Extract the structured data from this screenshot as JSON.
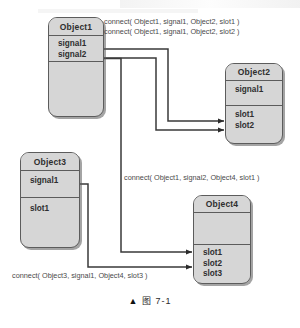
{
  "figure": {
    "caption_marker": "▲",
    "caption_label": "图",
    "caption_number": "7-1",
    "type": "signals-and-slots connection diagram"
  },
  "palette": {
    "box_fill": "#d6d6d6",
    "box_border": "#5c5c5c",
    "wire": "#3a3a3a",
    "text": "#2e2e2e",
    "label_text": "#4a4a4a",
    "page_background": "#ffffff"
  },
  "objects": [
    {
      "id": "object1",
      "title": "Object1",
      "signals": [
        "signal1",
        "signal2"
      ],
      "slots": []
    },
    {
      "id": "object2",
      "title": "Object2",
      "signals": [
        "signal1"
      ],
      "slots": [
        "slot1",
        "slot2"
      ]
    },
    {
      "id": "object3",
      "title": "Object3",
      "signals": [
        "signal1"
      ],
      "slots": [
        "slot1"
      ]
    },
    {
      "id": "object4",
      "title": "Object4",
      "signals": [],
      "slots": [
        "slot1",
        "slot2",
        "slot3"
      ]
    }
  ],
  "connections": [
    {
      "id": "conn1",
      "label": "connect( Object1, signal1, Object2, slot1 )",
      "from_object": "Object1",
      "from_signal": "signal1",
      "to_object": "Object2",
      "to_slot": "slot1"
    },
    {
      "id": "conn2",
      "label": "connect( Object1, signal1, Object2, slot2 )",
      "from_object": "Object1",
      "from_signal": "signal1",
      "to_object": "Object2",
      "to_slot": "slot2"
    },
    {
      "id": "conn3",
      "label": "connect( Object1, signal2, Object4, slot1 )",
      "from_object": "Object1",
      "from_signal": "signal2",
      "to_object": "Object4",
      "to_slot": "slot1"
    },
    {
      "id": "conn4",
      "label": "connect( Object3, signal1, Object4, slot3 )",
      "from_object": "Object3",
      "from_signal": "signal1",
      "to_object": "Object4",
      "to_slot": "slot3"
    }
  ]
}
